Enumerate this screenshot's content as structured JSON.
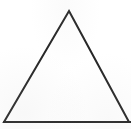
{
  "figure": {
    "kind": "line-drawing",
    "caption": "",
    "background_color": "#ffffff",
    "stroke_color": "#262626",
    "stroke_width": 2,
    "fill": "none",
    "canvas": {
      "width": 131,
      "height": 129
    }
  },
  "chart_data": {
    "type": "scatter",
    "title": "",
    "xlabel": "",
    "ylabel": "",
    "grid": false,
    "legend": "none",
    "xlim": [
      0,
      131
    ],
    "ylim": [
      0,
      129
    ],
    "shapes": [
      {
        "name": "triangle",
        "type": "polygon",
        "closed": true,
        "stroke": "#262626",
        "stroke_width": 2,
        "fill": "none",
        "vertices": [
          {
            "label": "apex",
            "x": 69,
            "y": 11
          },
          {
            "label": "bottom-right",
            "x": 129,
            "y": 122
          },
          {
            "label": "bottom-left",
            "x": 4,
            "y": 122
          }
        ],
        "edges": [
          {
            "label": "left-side",
            "from": "apex",
            "to": "bottom-left"
          },
          {
            "label": "right-side",
            "from": "apex",
            "to": "bottom-right"
          },
          {
            "label": "base",
            "from": "bottom-left",
            "to": "bottom-right"
          }
        ]
      }
    ]
  }
}
